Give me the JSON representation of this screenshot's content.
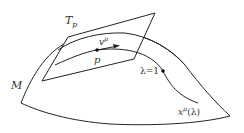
{
  "diagram": {
    "type": "tangent-space-illustration",
    "labels": {
      "manifold": "M",
      "tangent_plane": "T",
      "tangent_plane_sub": "p",
      "point": "p",
      "vector": "v",
      "vector_sup": "μ",
      "param_point": "λ=1",
      "curve": "x",
      "curve_sup": "μ",
      "curve_arg": "(λ)"
    },
    "colors": {
      "stroke": "#222222",
      "text": "#333333",
      "background": "#ffffff"
    }
  }
}
